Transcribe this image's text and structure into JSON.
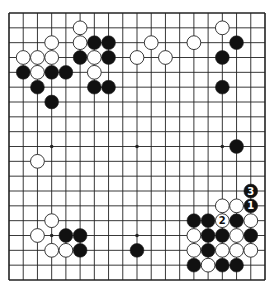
{
  "diagram": {
    "type": "go-board",
    "size": 19,
    "colors": {
      "background": "#ffffff",
      "line": "#222222",
      "black": "#111111",
      "white": "#ffffff",
      "stone_outline": "#222222"
    },
    "hoshi": [
      [
        3,
        3
      ],
      [
        9,
        3
      ],
      [
        15,
        3
      ],
      [
        3,
        9
      ],
      [
        9,
        9
      ],
      [
        15,
        9
      ],
      [
        3,
        15
      ],
      [
        9,
        15
      ],
      [
        15,
        15
      ]
    ],
    "stones": [
      {
        "color": "white",
        "col": 5,
        "row": 1
      },
      {
        "color": "white",
        "col": 15,
        "row": 1
      },
      {
        "color": "white",
        "col": 3,
        "row": 2
      },
      {
        "color": "white",
        "col": 5,
        "row": 2
      },
      {
        "color": "black",
        "col": 6,
        "row": 2
      },
      {
        "color": "black",
        "col": 7,
        "row": 2
      },
      {
        "color": "white",
        "col": 10,
        "row": 2
      },
      {
        "color": "white",
        "col": 13,
        "row": 2
      },
      {
        "color": "black",
        "col": 16,
        "row": 2
      },
      {
        "color": "white",
        "col": 1,
        "row": 3
      },
      {
        "color": "white",
        "col": 2,
        "row": 3
      },
      {
        "color": "white",
        "col": 3,
        "row": 3
      },
      {
        "color": "black",
        "col": 5,
        "row": 3
      },
      {
        "color": "white",
        "col": 6,
        "row": 3
      },
      {
        "color": "black",
        "col": 7,
        "row": 3
      },
      {
        "color": "white",
        "col": 9,
        "row": 3
      },
      {
        "color": "white",
        "col": 11,
        "row": 3
      },
      {
        "color": "black",
        "col": 15,
        "row": 3
      },
      {
        "color": "black",
        "col": 1,
        "row": 4
      },
      {
        "color": "white",
        "col": 2,
        "row": 4
      },
      {
        "color": "black",
        "col": 3,
        "row": 4
      },
      {
        "color": "black",
        "col": 4,
        "row": 4
      },
      {
        "color": "white",
        "col": 6,
        "row": 4
      },
      {
        "color": "black",
        "col": 2,
        "row": 5
      },
      {
        "color": "black",
        "col": 6,
        "row": 5
      },
      {
        "color": "black",
        "col": 7,
        "row": 5
      },
      {
        "color": "black",
        "col": 15,
        "row": 5
      },
      {
        "color": "black",
        "col": 3,
        "row": 6
      },
      {
        "color": "black",
        "col": 16,
        "row": 9
      },
      {
        "color": "white",
        "col": 2,
        "row": 10
      },
      {
        "color": "black",
        "col": 17,
        "row": 12,
        "label": "3"
      },
      {
        "color": "white",
        "col": 15,
        "row": 13
      },
      {
        "color": "white",
        "col": 16,
        "row": 13
      },
      {
        "color": "black",
        "col": 17,
        "row": 13,
        "label": "1"
      },
      {
        "color": "white",
        "col": 3,
        "row": 14
      },
      {
        "color": "black",
        "col": 13,
        "row": 14
      },
      {
        "color": "black",
        "col": 14,
        "row": 14
      },
      {
        "color": "white",
        "col": 15,
        "row": 14,
        "label": "2"
      },
      {
        "color": "black",
        "col": 16,
        "row": 14
      },
      {
        "color": "white",
        "col": 17,
        "row": 14
      },
      {
        "color": "white",
        "col": 2,
        "row": 15
      },
      {
        "color": "black",
        "col": 4,
        "row": 15
      },
      {
        "color": "black",
        "col": 5,
        "row": 15
      },
      {
        "color": "white",
        "col": 13,
        "row": 15
      },
      {
        "color": "black",
        "col": 14,
        "row": 15
      },
      {
        "color": "black",
        "col": 15,
        "row": 15
      },
      {
        "color": "white",
        "col": 16,
        "row": 15
      },
      {
        "color": "black",
        "col": 17,
        "row": 15
      },
      {
        "color": "white",
        "col": 3,
        "row": 16
      },
      {
        "color": "white",
        "col": 4,
        "row": 16
      },
      {
        "color": "black",
        "col": 5,
        "row": 16
      },
      {
        "color": "black",
        "col": 9,
        "row": 16
      },
      {
        "color": "white",
        "col": 13,
        "row": 16
      },
      {
        "color": "black",
        "col": 14,
        "row": 16
      },
      {
        "color": "white",
        "col": 15,
        "row": 16
      },
      {
        "color": "white",
        "col": 16,
        "row": 16
      },
      {
        "color": "white",
        "col": 17,
        "row": 16
      },
      {
        "color": "black",
        "col": 13,
        "row": 17
      },
      {
        "color": "white",
        "col": 14,
        "row": 17
      },
      {
        "color": "black",
        "col": 15,
        "row": 17
      },
      {
        "color": "black",
        "col": 16,
        "row": 17
      }
    ]
  }
}
